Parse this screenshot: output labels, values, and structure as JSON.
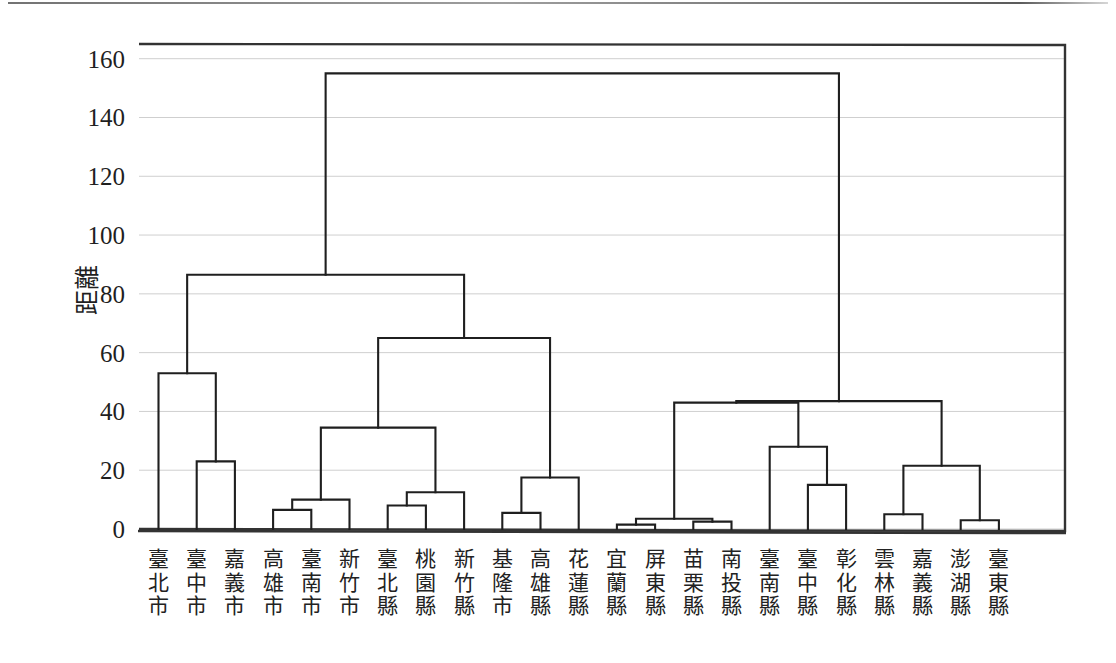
{
  "chart_data": {
    "type": "dendrogram",
    "title": "",
    "subtitle": "",
    "xlabel": "",
    "ylabel": "距離",
    "ylim": [
      0,
      165
    ],
    "yticks": [
      0,
      20,
      40,
      60,
      80,
      100,
      120,
      140,
      160
    ],
    "ytick_labels": [
      "0",
      "20",
      "40",
      "60",
      "80",
      "100",
      "120",
      "140",
      "160"
    ],
    "grid": true,
    "legend": "none",
    "orientation": "top-down",
    "leaf_count": 23,
    "categories": [
      "臺北市",
      "臺中市",
      "嘉義市",
      "高雄市",
      "臺南市",
      "新竹市",
      "臺北縣",
      "桃園縣",
      "新竹縣",
      "基隆市",
      "高雄縣",
      "花蓮縣",
      "宜蘭縣",
      "屏東縣",
      "苗栗縣",
      "南投縣",
      "臺南縣",
      "臺中縣",
      "彰化縣",
      "雲林縣",
      "嘉義縣",
      "澎湖縣",
      "臺東縣"
    ],
    "merges": [
      {
        "id": "m1",
        "label": "臺中市 + 嘉義市",
        "left": "臺中市",
        "right": "嘉義市",
        "height": 23
      },
      {
        "id": "m2",
        "label": "臺北市 + (臺中市,嘉義市)",
        "left": "臺北市",
        "right": "m1",
        "height": 53
      },
      {
        "id": "m3",
        "label": "高雄市 + 臺南市",
        "left": "高雄市",
        "right": "臺南市",
        "height": 6.5
      },
      {
        "id": "m4",
        "label": "(高雄市,臺南市) + 新竹市",
        "left": "m3",
        "right": "新竹市",
        "height": 10
      },
      {
        "id": "m5",
        "label": "臺北縣 + 桃園縣",
        "left": "臺北縣",
        "right": "桃園縣",
        "height": 8
      },
      {
        "id": "m6",
        "label": "(臺北縣,桃園縣) + 新竹縣",
        "left": "m5",
        "right": "新竹縣",
        "height": 12.5
      },
      {
        "id": "m7",
        "label": "西部都會群合併",
        "left": "m4",
        "right": "m6",
        "height": 34.5
      },
      {
        "id": "m8",
        "label": "基隆市 + 高雄縣",
        "left": "基隆市",
        "right": "高雄縣",
        "height": 5.5
      },
      {
        "id": "m9",
        "label": "(基隆市,高雄縣) + 花蓮縣",
        "left": "m8",
        "right": "花蓮縣",
        "height": 17.5
      },
      {
        "id": "m10",
        "label": "中型縣市群合併",
        "left": "m7",
        "right": "m9",
        "height": 65
      },
      {
        "id": "m11",
        "label": "都會大群合併",
        "left": "m2",
        "right": "m10",
        "height": 86.5
      },
      {
        "id": "m12",
        "label": "宜蘭縣 + 屏東縣",
        "left": "宜蘭縣",
        "right": "屏東縣",
        "height": 1.5
      },
      {
        "id": "m13",
        "label": "苗栗縣 + 南投縣",
        "left": "苗栗縣",
        "right": "南投縣",
        "height": 2.5
      },
      {
        "id": "m14",
        "label": "農業縣低階合併",
        "left": "m12",
        "right": "m13",
        "height": 3.5
      },
      {
        "id": "m15",
        "label": "臺中縣 + 彰化縣",
        "left": "臺中縣",
        "right": "彰化縣",
        "height": 15
      },
      {
        "id": "m16",
        "label": "臺南縣 + (臺中縣,彰化縣)",
        "left": "臺南縣",
        "right": "m15",
        "height": 28
      },
      {
        "id": "m17",
        "label": "農業縣主群合併",
        "left": "m14",
        "right": "m16",
        "height": 43
      },
      {
        "id": "m18",
        "label": "雲林縣 + 嘉義縣",
        "left": "雲林縣",
        "right": "嘉義縣",
        "height": 5
      },
      {
        "id": "m19",
        "label": "澎湖縣 + 臺東縣",
        "left": "澎湖縣",
        "right": "臺東縣",
        "height": 3
      },
      {
        "id": "m20",
        "label": "離島東部群合併",
        "left": "m18",
        "right": "m19",
        "height": 21.5
      },
      {
        "id": "m21",
        "label": "非都會大群合併",
        "left": "m17",
        "right": "m20",
        "height": 43.5
      },
      {
        "id": "m22",
        "label": "根節點合併",
        "left": "m11",
        "right": "m21",
        "height": 155
      }
    ],
    "root_height": 155,
    "line_color": "#1f1f1f",
    "grid_color": "#cfcfcf",
    "frame_color": "#333333",
    "background_color": "#ffffff"
  },
  "axis": {
    "y_title": "距離"
  }
}
